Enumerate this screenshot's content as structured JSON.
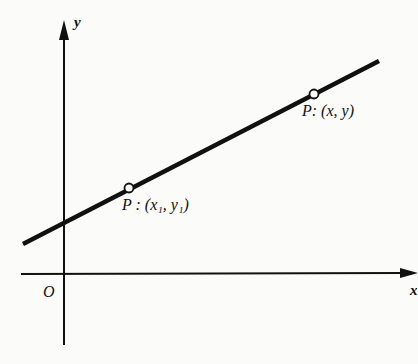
{
  "diagram": {
    "axes": {
      "x_label": "x",
      "y_label": "y",
      "origin_label": "O"
    },
    "points": [
      {
        "name": "P",
        "coords": "(x₁, y₁)",
        "label": "P : (x₁, y₁)"
      },
      {
        "name": "P",
        "coords": "(x, y)",
        "label": "P: (x, y)"
      }
    ],
    "colors": {
      "ink": "#111111",
      "background": "#fbfbf9"
    }
  }
}
